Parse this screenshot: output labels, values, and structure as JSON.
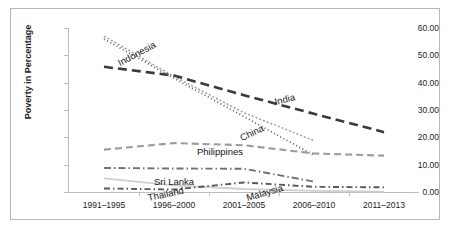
{
  "chart_data": {
    "type": "line",
    "title": "",
    "xlabel": "",
    "ylabel": "Poverty in Percentage",
    "categories": [
      "1991–1995",
      "1996–2000",
      "2001–2005",
      "2006–2010",
      "2011–2013"
    ],
    "ylim": [
      0,
      60
    ],
    "ytick_labels": [
      "0.00",
      "10.00",
      "20.00",
      "30.00",
      "40.00",
      "50.00",
      "60.00"
    ],
    "ytick_values": [
      0,
      10,
      20,
      30,
      40,
      50,
      60
    ],
    "grid": false,
    "legend_position": "inline-labels",
    "series": [
      {
        "name": "Indonesia",
        "values": [
          57.0,
          42.3,
          29.0,
          18.8,
          null
        ],
        "color": "#9a9a9a",
        "dash": "2,2",
        "width": 1.4,
        "label": {
          "x": 110,
          "y": 48,
          "rotate": -28
        }
      },
      {
        "name": "India",
        "values": [
          45.8,
          42.6,
          35.4,
          28.6,
          21.9
        ],
        "color": "#3a3a3a",
        "dash": "9,5",
        "width": 2.6,
        "label": {
          "x": 265,
          "y": 87,
          "rotate": -14
        }
      },
      {
        "name": "China",
        "values": [
          56.0,
          41.6,
          27.6,
          13.4,
          null
        ],
        "color": "#5e5e5e",
        "dash": "1,2.6",
        "width": 1.8,
        "label": {
          "x": 232,
          "y": 123,
          "rotate": -26
        }
      },
      {
        "name": "Philippines",
        "values": [
          15.5,
          17.9,
          17.1,
          14.1,
          13.3
        ],
        "color": "#9c9c9c",
        "dash": "7,4",
        "width": 2.1,
        "label": {
          "x": 186,
          "y": 137,
          "rotate": 0
        }
      },
      {
        "name": "Sri Lanka",
        "values": [
          8.8,
          8.6,
          8.5,
          3.8,
          null
        ],
        "color": "#707070",
        "dash": "7,3,1.5,3",
        "width": 1.9,
        "label": {
          "x": 143,
          "y": 167,
          "rotate": 0
        }
      },
      {
        "name": "Thailand",
        "values": [
          5.0,
          2.4,
          1.1,
          0.4,
          0.1
        ],
        "color": "#cfcfcf",
        "dash": "0",
        "width": 1.8,
        "label": {
          "x": 138,
          "y": 183,
          "rotate": -12
        }
      },
      {
        "name": "Malaysia",
        "values": [
          1.3,
          0.9,
          3.5,
          1.9,
          1.7
        ],
        "color": "#5a5a5a",
        "dash": "6,3,1.5,3",
        "width": 1.9,
        "label": {
          "x": 237,
          "y": 183,
          "rotate": -16
        }
      }
    ]
  },
  "axis": {
    "y_title": "Poverty in Percentage"
  },
  "colors": {
    "frame": "#b8b8b8",
    "axis": "#bdbdbd",
    "text": "#232323",
    "background": "#ffffff"
  }
}
